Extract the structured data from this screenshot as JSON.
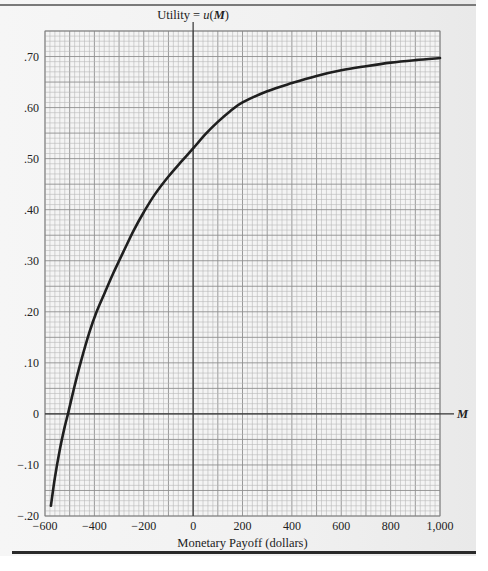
{
  "chart_data": {
    "type": "line",
    "title": "",
    "ylabel": "Utility = u(M)",
    "ylabel_parts": {
      "prefix": "Utility = ",
      "func": "u",
      "open": "(",
      "var": "M",
      "close": ")"
    },
    "xlabel": "Monetary Payoff (dollars)",
    "x_axis_symbol": "M",
    "xlim": [
      -600,
      1000
    ],
    "ylim": [
      -0.2,
      0.75
    ],
    "x_ticks": [
      -600,
      -400,
      -200,
      0,
      200,
      400,
      600,
      800,
      1000
    ],
    "x_tick_labels": [
      "−600",
      "−400",
      "−200",
      "0",
      "200",
      "400",
      "600",
      "800",
      "1,000"
    ],
    "y_ticks": [
      -0.2,
      -0.1,
      0,
      0.1,
      0.2,
      0.3,
      0.4,
      0.5,
      0.6,
      0.7
    ],
    "y_tick_labels": [
      "−.20",
      "−.10",
      "0",
      ".10",
      ".20",
      ".30",
      ".40",
      ".50",
      ".60",
      ".70"
    ],
    "grid": true,
    "grid_minor_x": 20,
    "grid_minor_y": 0.01,
    "grid_major_x": 100,
    "grid_major_y": 0.05,
    "legend": "none",
    "series": [
      {
        "name": "u(M)",
        "color": "#1f1f1f",
        "x": [
          -576,
          -560,
          -540,
          -520,
          -507,
          -480,
          -456,
          -420,
          -391,
          -360,
          -324,
          -280,
          -240,
          -200,
          -155,
          -100,
          -50,
          0,
          50,
          100,
          150,
          200,
          300,
          400,
          500,
          600,
          700,
          800,
          900,
          1000
        ],
        "y": [
          -0.18,
          -0.125,
          -0.07,
          -0.025,
          0.0,
          0.055,
          0.1,
          0.16,
          0.2,
          0.235,
          0.275,
          0.32,
          0.36,
          0.395,
          0.43,
          0.465,
          0.493,
          0.52,
          0.548,
          0.572,
          0.593,
          0.61,
          0.632,
          0.648,
          0.662,
          0.673,
          0.681,
          0.688,
          0.693,
          0.697
        ]
      }
    ],
    "colors": {
      "curve": "#1f1f1f",
      "axis": "#333333",
      "grid_minor": "#b9b9b9",
      "grid_major": "#8f8f8f",
      "panel": "#f3f3f3",
      "rule": "#2a2a2a"
    }
  }
}
